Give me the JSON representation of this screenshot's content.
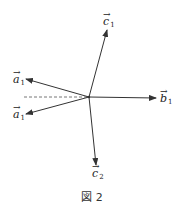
{
  "figure": {
    "caption": "図 2",
    "stroke_color": "#333333",
    "origin": {
      "x": 89,
      "y": 97
    },
    "dashed_line": {
      "x1": 24,
      "y1": 97,
      "x2": 89,
      "y2": 97
    },
    "vectors": [
      {
        "name": "a1-upper",
        "base": "a",
        "sub": "1",
        "tip": {
          "x": 26,
          "y": 79
        }
      },
      {
        "name": "a1-lower",
        "base": "a",
        "sub": "1",
        "tip": {
          "x": 26,
          "y": 114
        }
      },
      {
        "name": "b1",
        "base": "b",
        "sub": "1",
        "tip": {
          "x": 156,
          "y": 98
        }
      },
      {
        "name": "c1",
        "base": "c",
        "sub": "1",
        "tip": {
          "x": 107,
          "y": 30
        }
      },
      {
        "name": "c2",
        "base": "c",
        "sub": "2",
        "tip": {
          "x": 96,
          "y": 165
        }
      }
    ],
    "labels": {
      "a1_upper": {
        "base": "a",
        "sub": "1",
        "arrow": "→"
      },
      "a1_lower": {
        "base": "a",
        "sub": "1",
        "arrow": "→"
      },
      "b1": {
        "base": "b",
        "sub": "1",
        "arrow": "→"
      },
      "c1": {
        "base": "c",
        "sub": "1",
        "arrow": "→"
      },
      "c2": {
        "base": "c",
        "sub": "2",
        "arrow": "→"
      }
    }
  }
}
